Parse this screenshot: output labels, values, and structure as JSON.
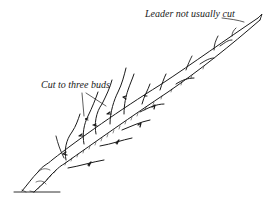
{
  "diagram": {
    "labels": {
      "leader": "Leader not usually cut",
      "buds": "Cut to three buds"
    },
    "colors": {
      "ink": "#1a1a1a",
      "background": "#ffffff"
    }
  }
}
